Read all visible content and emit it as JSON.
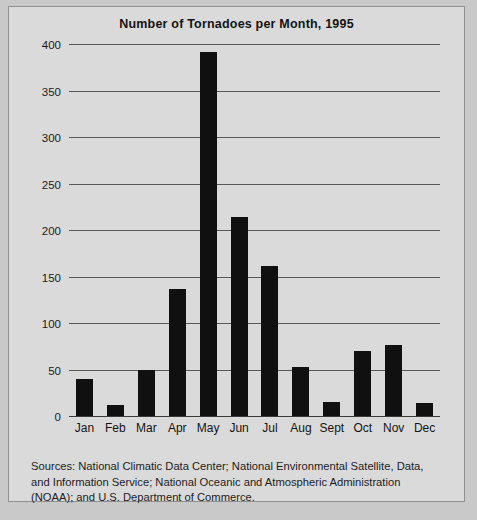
{
  "figure": {
    "background_color": "#dadada",
    "border_color": "#8f8f8f",
    "bar_color": "#101010",
    "gridline_color": "#585858"
  },
  "source_note": "Sources: National Climatic Data Center; National Environmental Satellite, Data, and Information Service; National Oceanic and Atmospheric Administration (NOAA); and U.S. Department of Commerce.",
  "page_footer_fragment": "",
  "chart_data": {
    "type": "bar",
    "title": "Number of Tornadoes per Month, 1995",
    "xlabel": "",
    "ylabel": "",
    "ylim": [
      0,
      400
    ],
    "yticks": [
      0,
      50,
      100,
      150,
      200,
      250,
      300,
      350,
      400
    ],
    "ytick_labels": [
      "0",
      "50",
      "100",
      "150",
      "200",
      "250",
      "300",
      "350",
      "400"
    ],
    "grid": true,
    "legend": false,
    "categories": [
      "Jan",
      "Feb",
      "Mar",
      "Apr",
      "May",
      "Jun",
      "Jul",
      "Aug",
      "Sept",
      "Oct",
      "Nov",
      "Dec"
    ],
    "values": [
      41,
      13,
      51,
      138,
      392,
      215,
      162,
      54,
      16,
      71,
      77,
      15
    ]
  }
}
